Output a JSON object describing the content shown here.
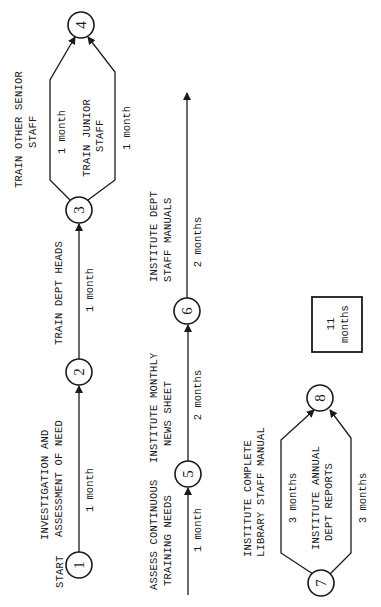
{
  "diagram": {
    "type": "activity-network",
    "orientation": "rotated-90-ccw",
    "start_label": "START",
    "nodes": [
      {
        "id": 1,
        "label": "1"
      },
      {
        "id": 2,
        "label": "2"
      },
      {
        "id": 3,
        "label": "3"
      },
      {
        "id": 4,
        "label": "4"
      },
      {
        "id": 5,
        "label": "5"
      },
      {
        "id": 6,
        "label": "6"
      },
      {
        "id": 7,
        "label": "7"
      },
      {
        "id": 8,
        "label": "8"
      }
    ],
    "activities": [
      {
        "from": "1",
        "to": "2",
        "name": [
          "INVESTIGATION AND",
          "ASSESSMENT OF NEED"
        ],
        "duration": "1 month"
      },
      {
        "from": "2",
        "to": "3",
        "name": [
          "TRAIN DEPT HEADS"
        ],
        "duration": "1 month"
      },
      {
        "from": "3",
        "to": "4",
        "name": [
          "TRAIN OTHER SENIOR",
          "STAFF"
        ],
        "duration": "1 month"
      },
      {
        "from": "3",
        "to": "4",
        "name": [
          "TRAIN JUNIOR",
          "STAFF"
        ],
        "duration": "1 month"
      },
      {
        "from": "start",
        "to": "5",
        "name": [
          "ASSESS CONTINUOUS",
          "TRAINING NEEDS"
        ],
        "duration": "1 month"
      },
      {
        "from": "5",
        "to": "6",
        "name": [
          "INSTITUTE MONTHLY",
          "NEWS SHEET"
        ],
        "duration": "2 months"
      },
      {
        "from": "6",
        "to": "end",
        "name": [
          "INSTITUTE DEPT",
          "STAFF MANUALS"
        ],
        "duration": "2 months"
      },
      {
        "from": "7",
        "to": "8",
        "name": [
          "INSTITUTE COMPLETE",
          "LIBRARY STAFF MANUAL"
        ],
        "duration": "3 months"
      },
      {
        "from": "7",
        "to": "8",
        "name": [
          "INSTITUTE ANNUAL",
          "DEPT REPORTS"
        ],
        "duration": "3 months"
      }
    ],
    "total": {
      "value": "11",
      "unit": "months"
    }
  }
}
